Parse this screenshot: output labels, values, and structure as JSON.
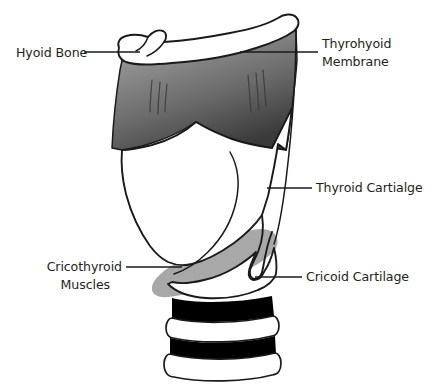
{
  "figure": {
    "background_color": "#ffffff",
    "line_color": "#1a1a1a",
    "text_color": "#231f20"
  },
  "labels": [
    {
      "id": "hyoid-bone",
      "text": "Hyoid Bone",
      "lines": [
        "Hyoid Bone"
      ],
      "side": "left",
      "text_x": 16,
      "text_y": 58,
      "leader": "M 84 52 L 140 52"
    },
    {
      "id": "thyrohyoid-membrane",
      "text": "Thyrohyoid Membrane",
      "lines": [
        "Thyrohyoid",
        "Membrane"
      ],
      "side": "right",
      "text_x": 322,
      "text_y": 53,
      "leader": "M 272 52 L 318 52"
    },
    {
      "id": "thyroid-cartilage",
      "text": "Thyroid Cartialge",
      "lines": [
        "Thyroid Cartialge"
      ],
      "side": "right",
      "text_x": 316,
      "text_y": 192,
      "leader": "M 267 188 L 312 188"
    },
    {
      "id": "cricoid-cartilage",
      "text": "Cricoid Cartilage",
      "lines": [
        "Cricoid Cartilage"
      ],
      "side": "right",
      "text_x": 306,
      "text_y": 281,
      "leader": "M 255 277 L 302 277"
    },
    {
      "id": "cricothyroid-muscles",
      "text": "Cricothyroid Muscles",
      "lines": [
        "Cricothyroid",
        "Muscles"
      ],
      "side": "left",
      "text_x": 44,
      "text_y": 270,
      "leader": "M 126 267 L 182 267"
    }
  ],
  "structures": [
    {
      "id": "hyoid-bone-shape",
      "name": "Hyoid Bone",
      "fill": "#ffffff",
      "stroke": "#1a1a1a"
    },
    {
      "id": "thyrohyoid-membrane-shape",
      "name": "Thyrohyoid Membrane",
      "fill_gradient": [
        "#9a9a9a",
        "#6e6e6e",
        "#3d3d3d"
      ],
      "stroke": "#1a1a1a",
      "has_striations": true
    },
    {
      "id": "thyroid-cartilage-shape",
      "name": "Thyroid Cartilage",
      "fill": "#ffffff",
      "stroke": "#1a1a1a"
    },
    {
      "id": "cricothyroid-muscle-shape",
      "name": "Cricothyroid Muscles",
      "fill": "#a8a8a8",
      "stroke": "none"
    },
    {
      "id": "cricoid-cartilage-shape",
      "name": "Cricoid Cartilage",
      "fill": "#ffffff",
      "stroke": "#1a1a1a"
    },
    {
      "id": "trachea-shape",
      "name": "Tracheal rings",
      "ring_fill": "#ffffff",
      "band_fill": "#000000",
      "stroke": "#1a1a1a",
      "band_count": 2,
      "ring_count": 3
    }
  ]
}
